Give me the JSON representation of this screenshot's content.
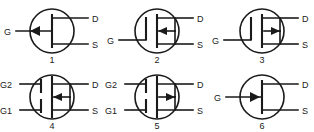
{
  "figure": {
    "background_color": "#ffffff",
    "line_color": "#1a1a1a",
    "rows": 2,
    "columns": 3
  },
  "symbols": [
    {
      "index_label": "1",
      "name": "jfet-arrow-in-gate-left",
      "gate_label": "G",
      "drain_label": "D",
      "source_label": "S",
      "gate_count": 1,
      "arrow_direction": "left",
      "arrow_position": "gate-lead",
      "gate_bars": 0,
      "channel_style": "solid",
      "col": 0,
      "row": 0
    },
    {
      "index_label": "2",
      "name": "mosfet-single-gate-arrow-left",
      "gate_label": "G",
      "drain_label": "D",
      "source_label": "S",
      "gate_count": 1,
      "arrow_direction": "left",
      "arrow_position": "substrate-mid",
      "gate_bars": 1,
      "channel_style": "solid",
      "col": 1,
      "row": 0
    },
    {
      "index_label": "3",
      "name": "mosfet-single-gate-arrow-right",
      "gate_label": "G",
      "drain_label": "D",
      "source_label": "S",
      "gate_count": 1,
      "arrow_direction": "right",
      "arrow_position": "substrate-mid",
      "gate_bars": 1,
      "channel_style": "solid",
      "col": 2,
      "row": 0
    },
    {
      "index_label": "4",
      "name": "dual-gate-mosfet-arrow-left",
      "gate_label_upper": "G2",
      "gate_label_lower": "G1",
      "drain_label": "D",
      "source_label": "S",
      "gate_count": 2,
      "arrow_direction": "left",
      "arrow_position": "substrate-mid",
      "gate_bars": 2,
      "channel_style": "solid",
      "col": 0,
      "row": 1
    },
    {
      "index_label": "5",
      "name": "dual-gate-mosfet-arrow-right",
      "gate_label_upper": "G2",
      "gate_label_lower": "G1",
      "drain_label": "D",
      "source_label": "S",
      "gate_count": 2,
      "arrow_direction": "right",
      "arrow_position": "substrate-mid",
      "gate_bars": 2,
      "channel_style": "solid",
      "col": 1,
      "row": 1
    },
    {
      "index_label": "6",
      "name": "jfet-arrow-in-gate-right",
      "gate_label": "G",
      "drain_label": "D",
      "source_label": "S",
      "gate_count": 1,
      "arrow_direction": "right",
      "arrow_position": "gate-lead",
      "gate_bars": 0,
      "channel_style": "solid",
      "col": 2,
      "row": 1
    }
  ]
}
